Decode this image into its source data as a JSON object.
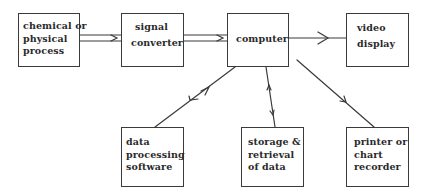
{
  "diagram": {
    "type": "block-diagram",
    "nodes": [
      {
        "id": "process",
        "lines": [
          "chemical or",
          "physical",
          "process"
        ]
      },
      {
        "id": "converter",
        "lines": [
          "signal",
          "converter"
        ]
      },
      {
        "id": "computer",
        "lines": [
          "computer"
        ]
      },
      {
        "id": "video",
        "lines": [
          "video",
          "display"
        ]
      },
      {
        "id": "software",
        "lines": [
          "data",
          "processing",
          "software"
        ]
      },
      {
        "id": "storage",
        "lines": [
          "storage &",
          "retrieval",
          "of data"
        ]
      },
      {
        "id": "printer",
        "lines": [
          "printer or",
          "chart",
          "recorder"
        ]
      }
    ],
    "edges": [
      {
        "from": "process",
        "to": "converter",
        "style": "double-line",
        "direction": "forward"
      },
      {
        "from": "converter",
        "to": "computer",
        "style": "double-line",
        "direction": "forward"
      },
      {
        "from": "computer",
        "to": "video",
        "style": "single-line",
        "direction": "forward"
      },
      {
        "from": "computer",
        "to": "software",
        "style": "single-line",
        "direction": "bidirectional"
      },
      {
        "from": "computer",
        "to": "storage",
        "style": "single-line",
        "direction": "bidirectional"
      },
      {
        "from": "computer",
        "to": "printer",
        "style": "single-line",
        "direction": "forward"
      }
    ],
    "colors": {
      "line": "#3a3a3a",
      "text": "#2a2a2a",
      "background": "#ffffff"
    }
  }
}
